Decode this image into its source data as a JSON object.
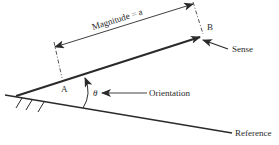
{
  "diagram": {
    "labels": {
      "magnitude": "Magnitude = a",
      "point_a": "A",
      "point_b": "B",
      "sense": "Sense",
      "theta": "θ",
      "orientation": "Orientation",
      "reference": "Reference"
    },
    "colors": {
      "ink": "#2a2a2a",
      "background": "#ffffff"
    }
  }
}
